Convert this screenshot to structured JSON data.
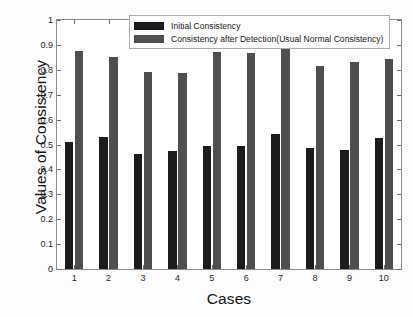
{
  "chart_data": {
    "type": "bar",
    "title": "",
    "xlabel": "Cases",
    "ylabel": "Values of Consistency",
    "categories": [
      "1",
      "2",
      "3",
      "4",
      "5",
      "6",
      "7",
      "8",
      "9",
      "10"
    ],
    "series": [
      {
        "name": "Initial Consistency",
        "color": "#1c1c1c",
        "values": [
          0.512,
          0.531,
          0.462,
          0.475,
          0.494,
          0.496,
          0.543,
          0.485,
          0.476,
          0.527
        ]
      },
      {
        "name": "Consistency after Detection(Usual Normal Consistency)",
        "color": "#4f4f4f",
        "values": [
          0.877,
          0.851,
          0.792,
          0.787,
          0.873,
          0.868,
          0.882,
          0.816,
          0.832,
          0.844
        ]
      }
    ],
    "ylim": [
      0,
      1
    ],
    "yticks": [
      "0",
      "0.1",
      "0.2",
      "0.3",
      "0.4",
      "0.5",
      "0.6",
      "0.7",
      "0.8",
      "0.9",
      "1"
    ],
    "ytick_values": [
      0,
      0.1,
      0.2,
      0.3,
      0.4,
      0.5,
      0.6,
      0.7,
      0.8,
      0.9,
      1
    ],
    "xticks": [
      "1",
      "2",
      "3",
      "4",
      "5",
      "6",
      "7",
      "8",
      "9",
      "10"
    ],
    "grid": false,
    "legend_position": "top-center"
  },
  "legend": {
    "entries": [
      {
        "label": "Initial Consistency"
      },
      {
        "label": "Consistency after Detection(Usual Normal Consistency)"
      }
    ]
  },
  "axes": {
    "x_title": "Cases",
    "y_title": "Values of Consistency"
  }
}
